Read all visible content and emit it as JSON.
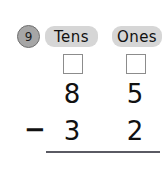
{
  "problem": {
    "number": "9",
    "operator": "−",
    "columns": [
      {
        "header": "Tens",
        "minuend_digit": "8",
        "subtrahend_digit": "3",
        "regroup_value": ""
      },
      {
        "header": "Ones",
        "minuend_digit": "5",
        "subtrahend_digit": "2",
        "regroup_value": ""
      }
    ],
    "minuend": "85",
    "subtrahend": "32",
    "answer": ""
  },
  "colors": {
    "badge_fill": "#a6a6a6",
    "header_fill": "#d6d6d6",
    "ink": "#111111",
    "rule": "#5a5a63",
    "box_border": "#8c8c8c",
    "background": "#ffffff"
  }
}
